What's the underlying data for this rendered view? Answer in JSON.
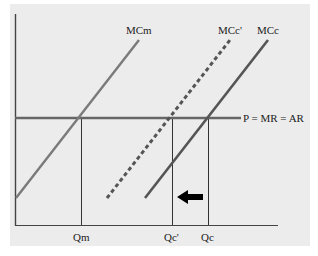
{
  "diagram": {
    "type": "economics-supply-diagram",
    "curves": [
      {
        "id": "MCm",
        "label": "MCm",
        "style": "solid",
        "color": "#7a7a7a"
      },
      {
        "id": "MCc_prime",
        "label": "MCc'",
        "style": "dashed",
        "color": "#555555"
      },
      {
        "id": "MCc",
        "label": "MCc",
        "style": "solid",
        "color": "#555555"
      }
    ],
    "price_line": {
      "label": "P = MR = AR",
      "color": "#666666"
    },
    "quantities": [
      {
        "id": "Qm",
        "label": "Qm"
      },
      {
        "id": "Qc_prime",
        "label": "Qc'"
      },
      {
        "id": "Qc",
        "label": "Qc"
      }
    ],
    "arrow": {
      "direction": "left",
      "meaning": "shift from Qc to Qc'"
    },
    "colors": {
      "background": "#ececec",
      "axis": "#444444",
      "arrow": "#000000"
    }
  }
}
